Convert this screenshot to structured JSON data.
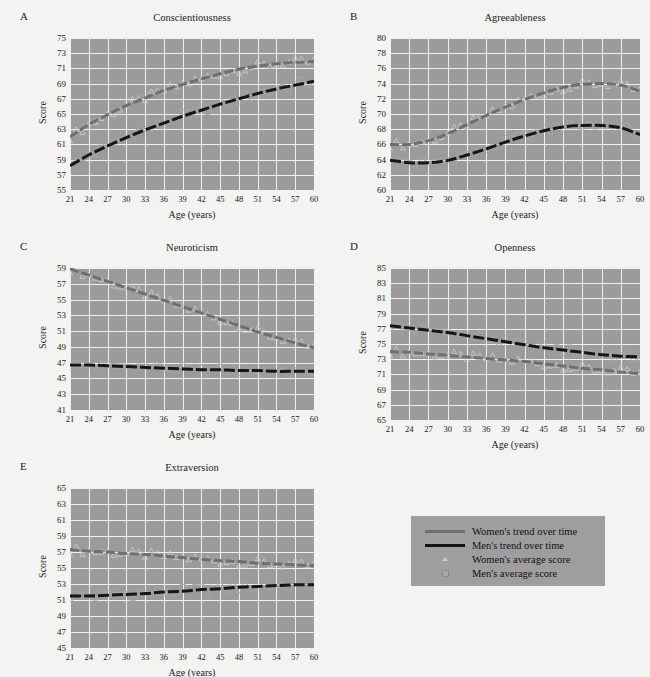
{
  "figure": {
    "background_color": "#f3f3f1",
    "plot_background_color": "#9b9b9b",
    "gridline_color": "#efefef",
    "women_line_color": "#6f6f6f",
    "men_line_color": "#161616",
    "women_marker_color": "#c9c9c9",
    "men_marker_color": "#a6a6a6"
  },
  "legend": {
    "items": [
      {
        "label": "Women's trend over time",
        "kind": "line",
        "icon": "line-swatch-women"
      },
      {
        "label": "Men's trend over time",
        "kind": "line",
        "icon": "line-swatch-men"
      },
      {
        "label": "Women's average score",
        "kind": "marker",
        "icon": "triangle-marker-women"
      },
      {
        "label": "Men's average score",
        "kind": "marker",
        "icon": "square-marker-men"
      }
    ]
  },
  "chart_data": [
    {
      "type": "line",
      "panel": "A",
      "title": "Conscientiousness",
      "xlabel": "Age (years)",
      "ylabel": "Score",
      "xlim": [
        21,
        60
      ],
      "ylim": [
        55,
        75
      ],
      "xticks": [
        "21",
        "24",
        "27",
        "30",
        "33",
        "36",
        "39",
        "42",
        "45",
        "48",
        "51",
        "54",
        "57",
        "60"
      ],
      "yticks": [
        "55",
        "57",
        "59",
        "61",
        "63",
        "65",
        "67",
        "69",
        "71",
        "73",
        "75"
      ],
      "grid": true,
      "x": [
        21,
        24,
        27,
        30,
        33,
        36,
        39,
        42,
        45,
        48,
        51,
        54,
        57,
        60
      ],
      "series": [
        {
          "name": "Women's trend over time",
          "values": [
            62.0,
            63.6,
            64.9,
            66.1,
            67.1,
            68.1,
            68.9,
            69.6,
            70.3,
            70.9,
            71.3,
            71.6,
            71.8,
            71.9
          ]
        },
        {
          "name": "Men's trend over time",
          "values": [
            58.2,
            59.6,
            60.8,
            61.9,
            62.9,
            63.8,
            64.7,
            65.5,
            66.3,
            67.0,
            67.7,
            68.3,
            68.8,
            69.3
          ]
        }
      ]
    },
    {
      "type": "line",
      "panel": "B",
      "title": "Agreeableness",
      "xlabel": "Age (years)",
      "ylabel": "Score",
      "xlim": [
        21,
        60
      ],
      "ylim": [
        60,
        80
      ],
      "xticks": [
        "21",
        "24",
        "27",
        "30",
        "33",
        "36",
        "39",
        "42",
        "45",
        "48",
        "51",
        "54",
        "57",
        "60"
      ],
      "yticks": [
        "60",
        "62",
        "64",
        "66",
        "68",
        "70",
        "72",
        "74",
        "76",
        "78",
        "80"
      ],
      "grid": true,
      "x": [
        21,
        24,
        27,
        30,
        33,
        36,
        39,
        42,
        45,
        48,
        51,
        54,
        57,
        60
      ],
      "series": [
        {
          "name": "Women's trend over time",
          "values": [
            66.0,
            66.0,
            66.5,
            67.4,
            68.6,
            69.8,
            70.9,
            71.9,
            72.8,
            73.5,
            73.9,
            74.0,
            73.8,
            73.0
          ]
        },
        {
          "name": "Men's trend over time",
          "values": [
            63.9,
            63.6,
            63.6,
            63.9,
            64.6,
            65.4,
            66.3,
            67.1,
            67.8,
            68.3,
            68.5,
            68.5,
            68.2,
            67.3
          ]
        }
      ]
    },
    {
      "type": "line",
      "panel": "C",
      "title": "Neuroticism",
      "xlabel": "Age (years)",
      "ylabel": "Score",
      "xlim": [
        21,
        60
      ],
      "ylim": [
        41,
        59
      ],
      "xticks": [
        "21",
        "24",
        "27",
        "30",
        "33",
        "36",
        "39",
        "42",
        "45",
        "48",
        "51",
        "54",
        "57",
        "60"
      ],
      "yticks": [
        "41",
        "43",
        "45",
        "47",
        "49",
        "51",
        "53",
        "55",
        "57",
        "59"
      ],
      "grid": true,
      "x": [
        21,
        24,
        27,
        30,
        33,
        36,
        39,
        42,
        45,
        48,
        51,
        54,
        57,
        60
      ],
      "series": [
        {
          "name": "Women's trend over time",
          "values": [
            58.9,
            58.1,
            57.3,
            56.5,
            55.7,
            54.9,
            54.1,
            53.3,
            52.5,
            51.7,
            50.9,
            50.2,
            49.5,
            48.9
          ]
        },
        {
          "name": "Men's trend over time",
          "values": [
            46.7,
            46.7,
            46.6,
            46.5,
            46.4,
            46.3,
            46.2,
            46.1,
            46.1,
            46.0,
            46.0,
            45.9,
            45.9,
            45.9
          ]
        }
      ]
    },
    {
      "type": "line",
      "panel": "D",
      "title": "Openness",
      "xlabel": "Age (years)",
      "ylabel": "Score",
      "xlim": [
        21,
        60
      ],
      "ylim": [
        65,
        85
      ],
      "xticks": [
        "21",
        "24",
        "27",
        "30",
        "33",
        "36",
        "39",
        "42",
        "45",
        "48",
        "51",
        "54",
        "57",
        "60"
      ],
      "yticks": [
        "65",
        "67",
        "69",
        "71",
        "73",
        "75",
        "77",
        "79",
        "81",
        "83",
        "85"
      ],
      "grid": true,
      "x": [
        21,
        24,
        27,
        30,
        33,
        36,
        39,
        42,
        45,
        48,
        51,
        54,
        57,
        60
      ],
      "series": [
        {
          "name": "Women's trend over time",
          "values": [
            74.0,
            73.9,
            73.7,
            73.5,
            73.3,
            73.1,
            72.9,
            72.7,
            72.4,
            72.1,
            71.8,
            71.6,
            71.3,
            71.1
          ]
        },
        {
          "name": "Men's trend over time",
          "values": [
            77.4,
            77.1,
            76.8,
            76.5,
            76.1,
            75.7,
            75.3,
            74.9,
            74.5,
            74.2,
            73.9,
            73.6,
            73.4,
            73.3
          ]
        }
      ]
    },
    {
      "type": "line",
      "panel": "E",
      "title": "Extraversion",
      "xlabel": "Age (years)",
      "ylabel": "Score",
      "xlim": [
        21,
        60
      ],
      "ylim": [
        45,
        65
      ],
      "xticks": [
        "21",
        "24",
        "27",
        "30",
        "33",
        "36",
        "39",
        "42",
        "45",
        "48",
        "51",
        "54",
        "57",
        "60"
      ],
      "yticks": [
        "45",
        "47",
        "49",
        "51",
        "53",
        "55",
        "57",
        "59",
        "61",
        "63",
        "65"
      ],
      "grid": true,
      "x": [
        21,
        24,
        27,
        30,
        33,
        36,
        39,
        42,
        45,
        48,
        51,
        54,
        57,
        60
      ],
      "series": [
        {
          "name": "Women's trend over time",
          "values": [
            57.3,
            57.1,
            57.0,
            56.8,
            56.7,
            56.5,
            56.3,
            56.1,
            55.9,
            55.8,
            55.6,
            55.5,
            55.4,
            55.3
          ]
        },
        {
          "name": "Men's trend over time",
          "values": [
            51.5,
            51.5,
            51.6,
            51.7,
            51.8,
            52.0,
            52.1,
            52.3,
            52.4,
            52.6,
            52.7,
            52.8,
            52.9,
            52.9
          ]
        }
      ]
    }
  ]
}
